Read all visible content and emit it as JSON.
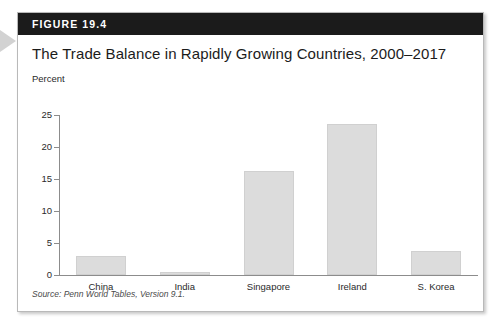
{
  "figure": {
    "number_label": "FIGURE 19.4",
    "title": "The Trade Balance in Rapidly Growing Countries, 2000–2017",
    "source": "Source: Penn World Tables, Version 9.1.",
    "pointer_icon": "triangle-right-icon"
  },
  "colors": {
    "header_bar": "#1b1b1b",
    "bar_fill": "#dcdcdc",
    "axis": "#8c8c8c",
    "card_border": "#b9b9b9",
    "pointer": "#d2d2d2"
  },
  "chart_data": {
    "type": "bar",
    "title": "The Trade Balance in Rapidly Growing Countries, 2000–2017",
    "categories": [
      "China",
      "India",
      "Singapore",
      "Ireland",
      "S. Korea"
    ],
    "values": [
      3.0,
      0.4,
      16.3,
      23.6,
      3.7
    ],
    "xlabel": "",
    "ylabel": "Percent",
    "ylim": [
      0,
      25
    ],
    "yticks": [
      0,
      5,
      10,
      15,
      20,
      25
    ],
    "ytick_labels": [
      "0",
      "5",
      "10",
      "15",
      "20",
      "25"
    ],
    "grid": false,
    "legend": false,
    "series": [
      {
        "name": "Trade balance (percent)",
        "values": [
          3.0,
          0.4,
          16.3,
          23.6,
          3.7
        ]
      }
    ]
  }
}
